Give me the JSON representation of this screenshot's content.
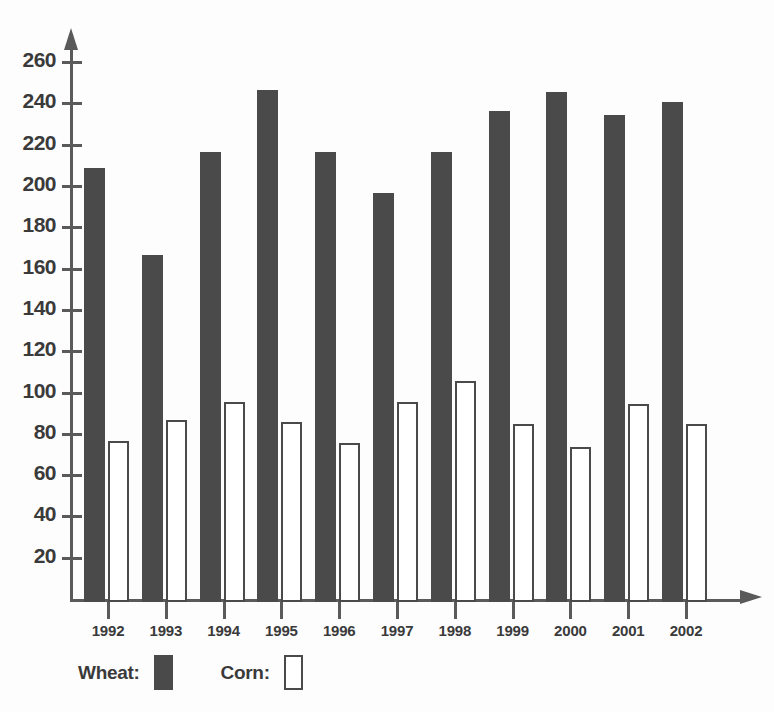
{
  "chart_data": {
    "type": "bar",
    "title": "",
    "subtitle": "",
    "xlabel": "",
    "ylabel": "",
    "categories": [
      "1992",
      "1993",
      "1994",
      "1995",
      "1996",
      "1997",
      "1998",
      "1999",
      "2000",
      "2001",
      "2002"
    ],
    "series": [
      {
        "name": "Wheat:",
        "color": "#4a4a4a",
        "style": "filled",
        "values": [
          210,
          168,
          218,
          248,
          218,
          198,
          218,
          238,
          247,
          236,
          242
        ]
      },
      {
        "name": "Corn:",
        "color": "#ffffff",
        "style": "outlined",
        "values": [
          78,
          88,
          97,
          87,
          77,
          97,
          107,
          86,
          75,
          96,
          86
        ]
      }
    ],
    "ylim": [
      0,
      270
    ],
    "y_ticks": [
      20,
      40,
      60,
      80,
      100,
      120,
      140,
      160,
      180,
      200,
      220,
      240,
      260
    ],
    "grid": false,
    "legend_position": "bottom-left",
    "axis_arrows": true
  },
  "legend": {
    "wheat_label": "Wheat:",
    "corn_label": "Corn:"
  },
  "colors": {
    "bar_dark": "#4a4a4a",
    "bar_light": "#ffffff",
    "axis": "#5a5a5a",
    "text": "#3a3a3a",
    "background": "#fdfdfd"
  }
}
